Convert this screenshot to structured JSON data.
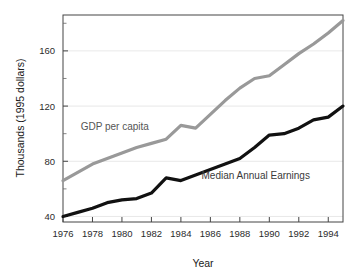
{
  "chart_data": {
    "type": "line",
    "title": "",
    "xlabel": "Year",
    "ylabel": "Thousands (1995 dollars)",
    "xlim": [
      1976,
      1995
    ],
    "ylim": [
      36,
      186
    ],
    "xticks": [
      1976,
      1978,
      1980,
      1982,
      1984,
      1986,
      1988,
      1990,
      1992,
      1994
    ],
    "xtick_labels": [
      "1976",
      "1978",
      "1980",
      "1982",
      "1984",
      "1986",
      "1988",
      "1990",
      "1992",
      "1994"
    ],
    "yticks": [
      40,
      80,
      120,
      160
    ],
    "ytick_labels": [
      "40",
      "80",
      "120",
      "160"
    ],
    "x": [
      1976,
      1977,
      1978,
      1979,
      1980,
      1981,
      1982,
      1983,
      1984,
      1985,
      1986,
      1987,
      1988,
      1989,
      1990,
      1991,
      1992,
      1993,
      1994,
      1995
    ],
    "grid": "horizontal",
    "legend_position": "inline-annotations",
    "series": [
      {
        "name": "GDP per capita",
        "color": "#999999",
        "label_x": 1977.2,
        "label_y": 103,
        "values": [
          66,
          72,
          78,
          82,
          86,
          90,
          93,
          96,
          106,
          104,
          114,
          124,
          133,
          140,
          142,
          150,
          158,
          165,
          173,
          182
        ]
      },
      {
        "name": "Median Annual Earnings",
        "color": "#111111",
        "label_x": 1985.4,
        "label_y": 67,
        "values": [
          40,
          43,
          46,
          50,
          52,
          53,
          57,
          68,
          66,
          70,
          74,
          78,
          82,
          90,
          99,
          100,
          104,
          110,
          112,
          120
        ]
      }
    ]
  },
  "axis": {
    "ylabel_text": "Thousands (1995 dollars)",
    "xlabel_text": "Year"
  }
}
